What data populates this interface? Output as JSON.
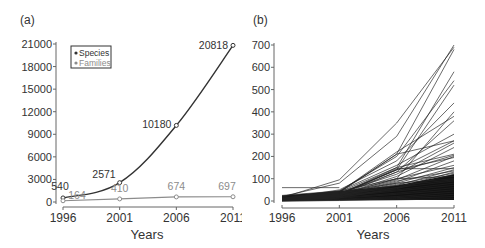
{
  "chart_data": [
    {
      "panel_label": "(a)",
      "type": "line",
      "title": "",
      "xlabel": "Years",
      "ylabel": "",
      "x": [
        1996,
        2001,
        2006,
        2011
      ],
      "xticks": [
        "1996",
        "2001",
        "2006",
        "2011"
      ],
      "yticks": [
        "0",
        "3000",
        "6000",
        "9000",
        "12000",
        "15000",
        "18000",
        "21000"
      ],
      "ylim": [
        0,
        21000
      ],
      "grid": false,
      "legend_position": "upper-left",
      "series": [
        {
          "name": "Species",
          "values": [
            540,
            2571,
            10180,
            20818
          ],
          "labels": [
            "540",
            "2571",
            "10180",
            "20818"
          ],
          "color": "#333333"
        },
        {
          "name": "Families",
          "values": [
            164,
            410,
            674,
            697
          ],
          "labels": [
            "164",
            "410",
            "674",
            "697"
          ],
          "color": "#8c8c8c"
        }
      ]
    },
    {
      "panel_label": "(b)",
      "type": "line",
      "title": "",
      "xlabel": "Years",
      "ylabel": "",
      "x": [
        1996,
        2001,
        2006,
        2011
      ],
      "xticks": [
        "1996",
        "2001",
        "2006",
        "2011"
      ],
      "yticks": [
        "0",
        "100",
        "200",
        "300",
        "400",
        "500",
        "600",
        "700"
      ],
      "ylim": [
        0,
        700
      ],
      "grid": false,
      "legend_position": "none",
      "note": "Many overlapping per-family series (black lines); representative subset of distinguishable lines",
      "series": [
        {
          "name": "s1",
          "values": [
            20,
            80,
            290,
            700
          ]
        },
        {
          "name": "s2",
          "values": [
            15,
            95,
            350,
            690
          ]
        },
        {
          "name": "s3",
          "values": [
            10,
            40,
            210,
            680
          ]
        },
        {
          "name": "s4",
          "values": [
            8,
            30,
            150,
            580
          ]
        },
        {
          "name": "s5",
          "values": [
            12,
            45,
            200,
            540
          ]
        },
        {
          "name": "s6",
          "values": [
            5,
            35,
            140,
            520
          ]
        },
        {
          "name": "s7",
          "values": [
            10,
            50,
            180,
            440
          ]
        },
        {
          "name": "s8",
          "values": [
            6,
            30,
            100,
            400
          ]
        },
        {
          "name": "s9",
          "values": [
            8,
            40,
            220,
            380
          ]
        },
        {
          "name": "s10",
          "values": [
            5,
            25,
            130,
            360
          ]
        },
        {
          "name": "s11",
          "values": [
            10,
            45,
            160,
            300
          ]
        },
        {
          "name": "s12",
          "values": [
            7,
            38,
            210,
            270
          ]
        },
        {
          "name": "s13",
          "values": [
            6,
            30,
            140,
            270
          ]
        },
        {
          "name": "s14",
          "values": [
            9,
            35,
            120,
            260
          ]
        },
        {
          "name": "s15",
          "values": [
            5,
            28,
            110,
            240
          ]
        },
        {
          "name": "s16",
          "values": [
            8,
            40,
            150,
            210
          ]
        },
        {
          "name": "s17",
          "values": [
            6,
            32,
            130,
            205
          ]
        },
        {
          "name": "s18",
          "values": [
            4,
            25,
            95,
            200
          ]
        },
        {
          "name": "s19",
          "values": [
            7,
            30,
            140,
            195
          ]
        },
        {
          "name": "s20",
          "values": [
            5,
            22,
            85,
            180
          ]
        },
        {
          "name": "s21",
          "values": [
            6,
            28,
            100,
            160
          ]
        },
        {
          "name": "s22",
          "values": [
            4,
            20,
            80,
            150
          ]
        },
        {
          "name": "s23",
          "values": [
            5,
            26,
            145,
            145
          ]
        },
        {
          "name": "s24",
          "values": [
            3,
            18,
            70,
            140
          ]
        },
        {
          "name": "s25",
          "values": [
            4,
            22,
            90,
            135
          ]
        },
        {
          "name": "s26",
          "values": [
            3,
            15,
            60,
            130
          ]
        },
        {
          "name": "s27",
          "values": [
            5,
            20,
            75,
            125
          ]
        },
        {
          "name": "s28",
          "values": [
            3,
            14,
            55,
            120
          ]
        },
        {
          "name": "s29",
          "values": [
            60,
            60,
            60,
            60
          ]
        },
        {
          "name": "s30",
          "values": [
            25,
            45,
            100,
            110
          ]
        },
        {
          "name": "s31",
          "values": [
            20,
            40,
            80,
            100
          ]
        },
        {
          "name": "s32",
          "values": [
            15,
            35,
            70,
            95
          ]
        },
        {
          "name": "s33",
          "values": [
            10,
            30,
            60,
            90
          ]
        },
        {
          "name": "s34",
          "values": [
            8,
            25,
            50,
            80
          ]
        },
        {
          "name": "s35",
          "values": [
            5,
            20,
            45,
            70
          ]
        },
        {
          "name": "s36",
          "values": [
            3,
            15,
            35,
            60
          ]
        },
        {
          "name": "s37",
          "values": [
            2,
            12,
            30,
            50
          ]
        },
        {
          "name": "s38",
          "values": [
            1,
            8,
            20,
            40
          ]
        },
        {
          "name": "s39",
          "values": [
            1,
            5,
            15,
            30
          ]
        },
        {
          "name": "s40",
          "values": [
            0,
            3,
            10,
            20
          ]
        },
        {
          "name": "s41",
          "values": [
            0,
            2,
            5,
            10
          ]
        }
      ],
      "dense_band": {
        "x": [
          1996,
          2001,
          2006,
          2011
        ],
        "lower": [
          0,
          5,
          5,
          5
        ],
        "upper": [
          25,
          45,
          70,
          120
        ]
      }
    }
  ],
  "panels": {
    "a": {
      "label": "(a)",
      "xlabel": "Years",
      "legend": [
        "Species",
        "Families"
      ]
    },
    "b": {
      "label": "(b)",
      "xlabel": "Years"
    }
  }
}
